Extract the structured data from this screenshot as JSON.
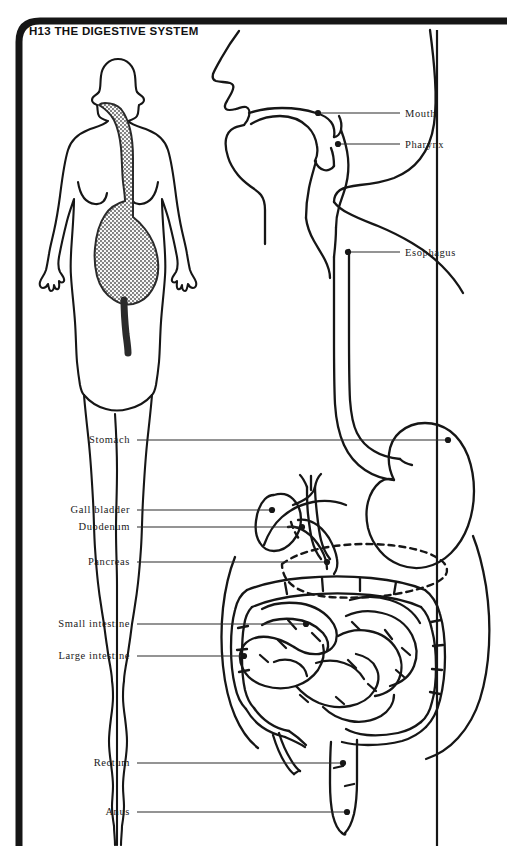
{
  "page": {
    "title": "H13  THE DIGESTIVE SYSTEM",
    "background_color": "#ffffff",
    "ink_color": "#111111",
    "frame_color": "#161616",
    "shading_color": "#8c8c8c"
  },
  "body_figure": {
    "name": "female-body-silhouette",
    "description": "front-view outline of a female human body with the digestive tract shaded"
  },
  "labels": {
    "right": [
      {
        "id": "mouth",
        "text": "Mouth",
        "text_x": 405,
        "text_y": 108,
        "line_x1": 400,
        "line_y1": 113,
        "line_x2": 318,
        "line_y2": 113,
        "dot_x": 318,
        "dot_y": 113,
        "has_dot": true
      },
      {
        "id": "pharynx",
        "text": "Pharynx",
        "text_x": 405,
        "text_y": 139,
        "line_x1": 400,
        "line_y1": 144,
        "line_x2": 338,
        "line_y2": 144,
        "dot_x": 338,
        "dot_y": 144,
        "has_dot": true
      },
      {
        "id": "esophagus",
        "text": "Esophagus",
        "text_x": 405,
        "text_y": 247,
        "line_x1": 400,
        "line_y1": 252,
        "line_x2": 348,
        "line_y2": 252,
        "dot_x": 348,
        "dot_y": 252,
        "has_dot": true
      }
    ],
    "left": [
      {
        "id": "stomach",
        "text": "Stomach",
        "text_x": 130,
        "text_y": 434,
        "line_x1": 137,
        "line_y1": 440,
        "line_x2": 448,
        "line_y2": 440,
        "dot_x": 448,
        "dot_y": 440,
        "has_dot": true
      },
      {
        "id": "gall-bladder",
        "text": "Gall bladder",
        "text_x": 130,
        "text_y": 504,
        "line_x1": 137,
        "line_y1": 510,
        "line_x2": 272,
        "line_y2": 510,
        "dot_x": 272,
        "dot_y": 510,
        "has_dot": true
      },
      {
        "id": "duodenum",
        "text": "Duodenum",
        "text_x": 130,
        "text_y": 521,
        "line_x1": 137,
        "line_y1": 527,
        "line_x2": 302,
        "line_y2": 527,
        "dot_x": 302,
        "dot_y": 527,
        "has_dot": true
      },
      {
        "id": "pancreas",
        "text": "Pancreas",
        "text_x": 130,
        "text_y": 556,
        "line_x1": 137,
        "line_y1": 562,
        "line_x2": 327,
        "line_y2": 562,
        "dot_x": 327,
        "dot_y": 562,
        "has_dot": true
      },
      {
        "id": "small-intestine",
        "text": "Small intestine",
        "text_x": 130,
        "text_y": 618,
        "line_x1": 137,
        "line_y1": 624,
        "line_x2": 306,
        "line_y2": 624,
        "dot_x": 306,
        "dot_y": 624,
        "has_dot": true
      },
      {
        "id": "large-intestine",
        "text": "Large intestine",
        "text_x": 130,
        "text_y": 650,
        "line_x1": 137,
        "line_y1": 656,
        "line_x2": 244,
        "line_y2": 656,
        "dot_x": 244,
        "dot_y": 656,
        "has_dot": true
      },
      {
        "id": "rectum",
        "text": "Rectum",
        "text_x": 130,
        "text_y": 757,
        "line_x1": 137,
        "line_y1": 763,
        "line_x2": 343,
        "line_y2": 763,
        "dot_x": 343,
        "dot_y": 763,
        "has_dot": true
      },
      {
        "id": "anus",
        "text": "Anus",
        "text_x": 130,
        "text_y": 806,
        "line_x1": 137,
        "line_y1": 812,
        "line_x2": 347,
        "line_y2": 812,
        "dot_x": 347,
        "dot_y": 812,
        "has_dot": true
      }
    ]
  },
  "organs": [
    "mouth",
    "pharynx",
    "esophagus",
    "stomach",
    "gall bladder",
    "duodenum",
    "pancreas",
    "small intestine",
    "large intestine",
    "rectum",
    "anus"
  ]
}
